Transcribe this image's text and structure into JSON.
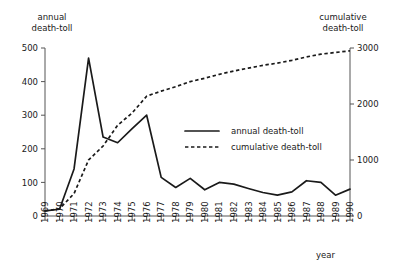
{
  "chart_data": {
    "type": "line",
    "title": "",
    "xlabel": "year",
    "left_axis_label": "annual\ndeath-toll",
    "right_axis_label": "cumulative\ndeath-toll",
    "grid": false,
    "legend_position": "center-right-inside",
    "x": [
      1969,
      1970,
      1971,
      1972,
      1973,
      1974,
      1975,
      1976,
      1977,
      1978,
      1979,
      1980,
      1981,
      1982,
      1983,
      1984,
      1985,
      1986,
      1987,
      1988,
      1989,
      1990
    ],
    "xtick_labels": [
      "1969",
      "1970",
      "1971",
      "1972",
      "1973",
      "1974",
      "1975",
      "1976",
      "1977",
      "1978",
      "1979",
      "1980",
      "1981",
      "1982",
      "1983",
      "1984",
      "1985",
      "1986",
      "1987",
      "1988",
      "1989",
      "1990"
    ],
    "ylim": [
      0,
      500
    ],
    "ytick_values": [
      0,
      100,
      200,
      300,
      400,
      500
    ],
    "ytick_labels": [
      "0",
      "100",
      "200",
      "300",
      "400",
      "500"
    ],
    "y2lim": [
      0,
      3000
    ],
    "y2tick_values": [
      0,
      1000,
      2000,
      3000
    ],
    "y2tick_labels": [
      "0",
      "1000",
      "2000",
      "3000"
    ],
    "series": [
      {
        "name": "annual death-toll",
        "axis": "left",
        "style": "solid",
        "values": [
          15,
          20,
          140,
          470,
          235,
          218,
          260,
          300,
          115,
          85,
          112,
          78,
          100,
          95,
          82,
          70,
          62,
          72,
          105,
          100,
          62,
          80
        ]
      },
      {
        "name": "cumulative death-toll",
        "axis": "right",
        "style": "dashed",
        "values": [
          90,
          130,
          400,
          1000,
          1250,
          1620,
          1840,
          2140,
          2230,
          2310,
          2400,
          2460,
          2530,
          2590,
          2640,
          2690,
          2730,
          2780,
          2840,
          2890,
          2920,
          2950
        ]
      }
    ],
    "legend_entries": [
      {
        "label": "annual death-toll",
        "style": "solid"
      },
      {
        "label": "cumulative death-toll",
        "style": "dashed"
      }
    ]
  }
}
